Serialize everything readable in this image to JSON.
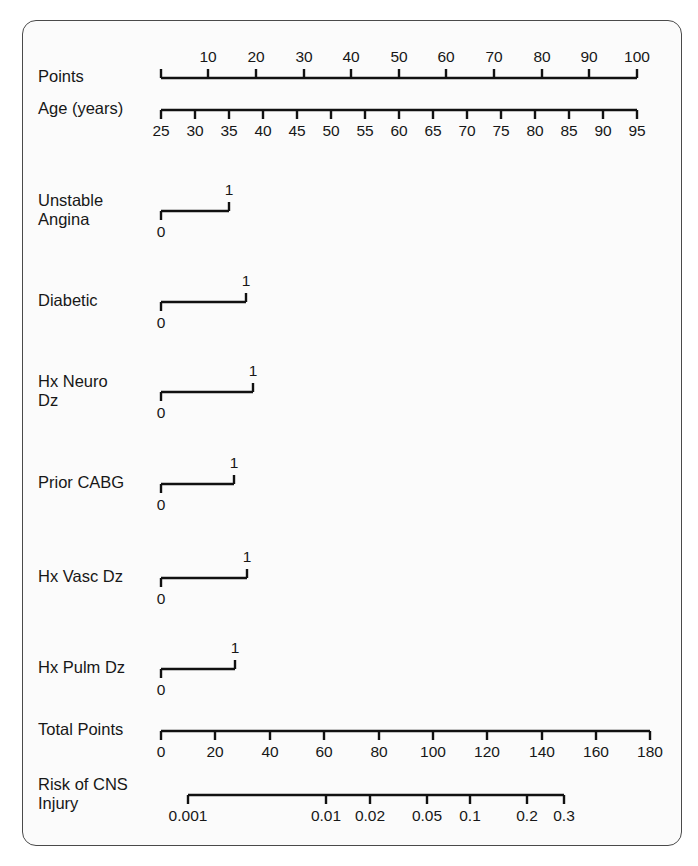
{
  "figure": {
    "kind": "nomogram",
    "title": "",
    "frame": {
      "x": 22,
      "y": 20,
      "width": 660,
      "height": 826,
      "radius": 14,
      "border_color": "#4a4a4a",
      "background": "#fbfbfb"
    },
    "ink_color": "#111111",
    "axis_left_x": 161,
    "axis_right_x": 650
  },
  "chart_data": {
    "type": "nomogram",
    "xlabel": "",
    "ylabel": "",
    "grid": false,
    "legend": "none",
    "rows": [
      {
        "name": "points",
        "label": "Points",
        "scale": "linear",
        "label_side": "above",
        "tick_dir": "up",
        "line_y": 78,
        "x_start": 161,
        "x_end": 637,
        "domain": [
          0,
          100
        ],
        "ticks": [
          0,
          10,
          20,
          30,
          40,
          50,
          60,
          70,
          80,
          90,
          100
        ],
        "tick_labels": [
          "",
          "10",
          "20",
          "30",
          "40",
          "50",
          "60",
          "70",
          "80",
          "90",
          "100"
        ],
        "tick_x": [
          161,
          208,
          256,
          304,
          351,
          399,
          446,
          494,
          542,
          589,
          637
        ]
      },
      {
        "name": "age",
        "label": "Age (years)",
        "scale": "linear",
        "label_side": "below",
        "tick_dir": "down",
        "line_y": 110,
        "x_start": 161,
        "x_end": 637,
        "domain": [
          25,
          95
        ],
        "ticks": [
          25,
          30,
          35,
          40,
          45,
          50,
          55,
          60,
          65,
          70,
          75,
          80,
          85,
          90,
          95
        ],
        "tick_labels": [
          "25",
          "30",
          "35",
          "40",
          "45",
          "50",
          "55",
          "60",
          "65",
          "70",
          "75",
          "80",
          "85",
          "90",
          "95"
        ],
        "tick_x": [
          161,
          195,
          229,
          263,
          297,
          331,
          365,
          399,
          433,
          467,
          501,
          535,
          569,
          603,
          637
        ]
      },
      {
        "name": "unstable-angina",
        "label": "Unstable\nAngina",
        "scale": "binary",
        "line_y": 211,
        "x_zero": 161,
        "x_one": 229,
        "points_span": 14.3,
        "value_labels": [
          "0",
          "1"
        ]
      },
      {
        "name": "diabetic",
        "label": "Diabetic",
        "scale": "binary",
        "line_y": 302,
        "x_zero": 161,
        "x_one": 246,
        "points_span": 17.9,
        "value_labels": [
          "0",
          "1"
        ]
      },
      {
        "name": "hx-neuro-dz",
        "label": "Hx Neuro\nDz",
        "scale": "binary",
        "line_y": 392,
        "x_zero": 161,
        "x_one": 253,
        "points_span": 19.3,
        "value_labels": [
          "0",
          "1"
        ]
      },
      {
        "name": "prior-cabg",
        "label": "Prior CABG",
        "scale": "binary",
        "line_y": 484,
        "x_zero": 161,
        "x_one": 234,
        "points_span": 15.3,
        "value_labels": [
          "0",
          "1"
        ]
      },
      {
        "name": "hx-vasc-dz",
        "label": "Hx Vasc Dz",
        "scale": "binary",
        "line_y": 578,
        "x_zero": 161,
        "x_one": 247,
        "points_span": 18.1,
        "value_labels": [
          "0",
          "1"
        ]
      },
      {
        "name": "hx-pulm-dz",
        "label": "Hx Pulm Dz",
        "scale": "binary",
        "line_y": 669,
        "x_zero": 161,
        "x_one": 235,
        "points_span": 15.5,
        "value_labels": [
          "0",
          "1"
        ]
      },
      {
        "name": "total-points",
        "label": "Total Points",
        "scale": "linear",
        "label_side": "below",
        "tick_dir": "down",
        "line_y": 731,
        "x_start": 161,
        "x_end": 650,
        "domain": [
          0,
          180
        ],
        "ticks": [
          0,
          20,
          40,
          60,
          80,
          100,
          120,
          140,
          160,
          180
        ],
        "tick_labels": [
          "0",
          "20",
          "40",
          "60",
          "80",
          "100",
          "120",
          "140",
          "160",
          "180"
        ],
        "tick_x": [
          161,
          215,
          270,
          324,
          379,
          433,
          487,
          542,
          596,
          650
        ]
      },
      {
        "name": "risk-of-cns-injury",
        "label": "Risk of CNS\nInjury",
        "scale": "logit",
        "label_side": "below",
        "tick_dir": "down",
        "line_y": 795,
        "x_start": 188,
        "x_end": 564,
        "ticks": [
          0.001,
          0.01,
          0.02,
          0.05,
          0.1,
          0.2,
          0.3
        ],
        "tick_labels": [
          "0.001",
          "0.01",
          "0.02",
          "0.05",
          "0.1",
          "0.2",
          "0.3"
        ],
        "tick_x": [
          188,
          326,
          370,
          427,
          470,
          527,
          564
        ]
      }
    ]
  }
}
